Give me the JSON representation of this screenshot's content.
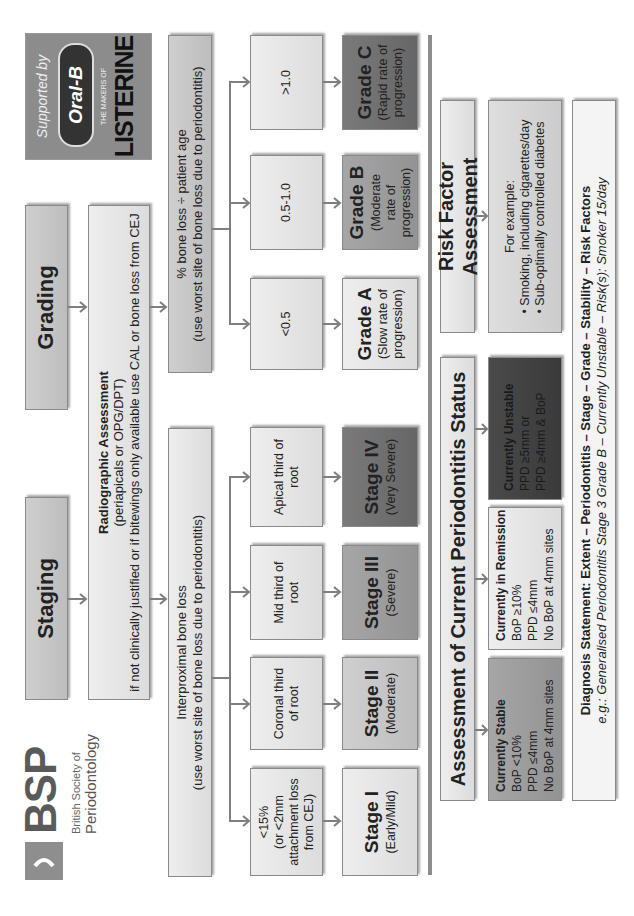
{
  "logo": {
    "acronym": "BSP",
    "line1": "British Society of",
    "line2": "Periodontology"
  },
  "sponsor": {
    "supported_by": "Supported by",
    "brand1": "Oral-B",
    "brand2_tag": "THE MAKERS OF",
    "brand2": "LISTERINE"
  },
  "headers": {
    "staging": "Staging",
    "grading": "Grading"
  },
  "radiographic": {
    "title": "Radiographic Assessment",
    "line2": "(periapicals or OPG/DPT)",
    "line3": "if not clinically justified or if bitewings only available use CAL or bone loss from CEJ"
  },
  "staging": {
    "measure_title": "Interproximal bone loss",
    "measure_sub": "(use worst site of bone loss due to periodontitis)",
    "criteria": [
      {
        "l1": "<15%",
        "l2": "(or <2mm",
        "l3": "attachment loss",
        "l4": "from CEJ)"
      },
      {
        "l1": "Coronal third",
        "l2": "of root"
      },
      {
        "l1": "Mid third of",
        "l2": "root"
      },
      {
        "l1": "Apical third of",
        "l2": "root"
      }
    ],
    "stages": [
      {
        "title": "Stage I",
        "sub": "(Early/Mild)"
      },
      {
        "title": "Stage II",
        "sub": "(Moderate)"
      },
      {
        "title": "Stage III",
        "sub": "(Severe)"
      },
      {
        "title": "Stage IV",
        "sub": "(Very Severe)"
      }
    ]
  },
  "grading": {
    "measure_title": "% bone loss ÷ patient age",
    "measure_sub": "(use worst site of bone loss due to periodontitis)",
    "criteria": [
      "<0.5",
      "0.5-1.0",
      ">1.0"
    ],
    "grades": [
      {
        "title": "Grade A",
        "l1": "(Slow rate of",
        "l2": "progression)"
      },
      {
        "title": "Grade B",
        "l1": "(Moderate",
        "l2": "rate of",
        "l3": "progression)"
      },
      {
        "title": "Grade C",
        "l1": "(Rapid rate of",
        "l2": "progression)"
      }
    ]
  },
  "status": {
    "header": "Assessment of Current Periodontitis Status",
    "items": [
      {
        "title": "Currently Stable",
        "l1": "BoP <10%",
        "l2": "PPD ≤4mm",
        "l3": "No BoP at 4mm sites"
      },
      {
        "title": "Currently in Remission",
        "l1": "BoP ≥10%",
        "l2": "PPD ≤4mm",
        "l3": "No BoP at 4mm sites"
      },
      {
        "title": "Currently Unstable",
        "l1": "PPD ≥5mm or",
        "l2": "PPD ≥4mm & BoP"
      }
    ]
  },
  "risk": {
    "header": "Risk Factor Assessment",
    "intro": "For example:",
    "items": [
      "Smoking, including cigarettes/day",
      "Sub-optimally controlled diabetes"
    ]
  },
  "diagnosis": {
    "statement": "Diagnosis Statement: Extent – Periodontitis – Stage – Grade – Stability – Risk Factors",
    "example": "e.g.: Generalised Periodontitis Stage 3 Grade B – Currently Unstable – Risk(s): Smoker 15/day"
  }
}
